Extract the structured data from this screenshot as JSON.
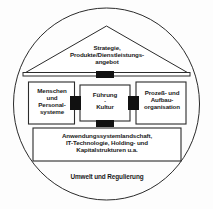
{
  "diagram": {
    "colors": {
      "stroke": "#2b2b2b",
      "fill": "#ffffff",
      "connector": "#111111",
      "background": "#fdfdfd",
      "text": "#1a1a1a"
    },
    "environment": {
      "label": "Umwelt und Regulierung",
      "shape": "ellipse"
    },
    "roof": {
      "shape": "triangle",
      "lines": [
        "Strategie,",
        "Produkte/Dienstleistungs-",
        "angebot"
      ],
      "label": "Strategie, Produkte/Dienstleistungsangebot"
    },
    "pillars": [
      {
        "id": "menschen",
        "lines": [
          "Menschen",
          "und",
          "Personal-",
          "systeme"
        ],
        "label": "Menschen und Personalsysteme"
      },
      {
        "id": "fuehrung",
        "lines": [
          "Führung",
          "-",
          "Kultur"
        ],
        "label": "Führung - Kultur",
        "top": "Führung",
        "separator": "-",
        "bottom": "Kultur"
      },
      {
        "id": "prozess",
        "lines": [
          "Prozeß- und",
          "Aufbau-",
          "organisation"
        ],
        "label": "Prozeß- und Aufbauorganisation"
      }
    ],
    "foundation": {
      "lines": [
        "Anwendungssystemlandschaft,",
        "IT-Technologie, Holding- und",
        "Kapitalstrukturen u.a."
      ],
      "label": "Anwendungssystemlandschaft, IT-Technologie, Holding- und Kapitalstrukturen u.a."
    },
    "connectors": [
      {
        "id": "roof-center",
        "position": "top"
      },
      {
        "id": "left-center",
        "position": "left"
      },
      {
        "id": "center-right",
        "position": "right"
      },
      {
        "id": "center-foundation",
        "position": "bottom"
      }
    ]
  }
}
